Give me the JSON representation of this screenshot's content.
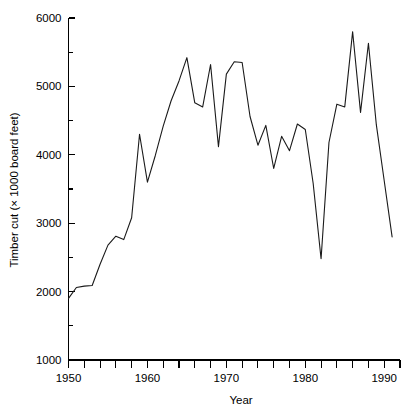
{
  "chart_data": {
    "type": "line",
    "title": "",
    "xlabel": "Year",
    "ylabel": "Timber cut (× 1000 board feet)",
    "xlim": [
      1950,
      1992
    ],
    "ylim": [
      1000,
      6000
    ],
    "grid": false,
    "legend": null,
    "x_major_ticks": [
      1950,
      1960,
      1970,
      1980,
      1990
    ],
    "x_major_tick_labels": [
      "1950",
      "1960",
      "1970",
      "1980",
      "1990"
    ],
    "x_minor_ticks": [
      1952,
      1954,
      1956,
      1958,
      1962,
      1964,
      1966,
      1968,
      1972,
      1974,
      1976,
      1978,
      1982,
      1984,
      1986,
      1988,
      1992
    ],
    "y_major_ticks": [
      1000,
      2000,
      3000,
      4000,
      5000,
      6000
    ],
    "y_major_tick_labels": [
      "1000",
      "2000",
      "3000",
      "4000",
      "5000",
      "6000"
    ],
    "y_minor_ticks": [
      1500,
      2500,
      3500,
      4500,
      5500
    ],
    "series": [
      {
        "name": "Timber cut",
        "color": "#1a1a1a",
        "x": [
          1950,
          1951,
          1952,
          1953,
          1954,
          1955,
          1956,
          1957,
          1958,
          1959,
          1960,
          1961,
          1962,
          1963,
          1964,
          1965,
          1966,
          1967,
          1968,
          1969,
          1970,
          1971,
          1972,
          1973,
          1974,
          1975,
          1976,
          1977,
          1978,
          1979,
          1980,
          1981,
          1982,
          1983,
          1984,
          1985,
          1986,
          1987,
          1988,
          1989,
          1990,
          1991
        ],
        "values": [
          1900,
          2060,
          2080,
          2090,
          2400,
          2680,
          2810,
          2760,
          3080,
          4300,
          3600,
          3990,
          4420,
          4790,
          5080,
          5420,
          4760,
          4700,
          5320,
          4120,
          5180,
          5360,
          5350,
          4560,
          4140,
          4430,
          3800,
          4270,
          4060,
          4450,
          4370,
          3580,
          2480,
          4180,
          4740,
          4700,
          5800,
          4620,
          5630,
          4440,
          3620,
          2800
        ]
      }
    ]
  },
  "axis_titles": {
    "x": "Year",
    "y": "Timber cut (× 1000 board feet)"
  }
}
